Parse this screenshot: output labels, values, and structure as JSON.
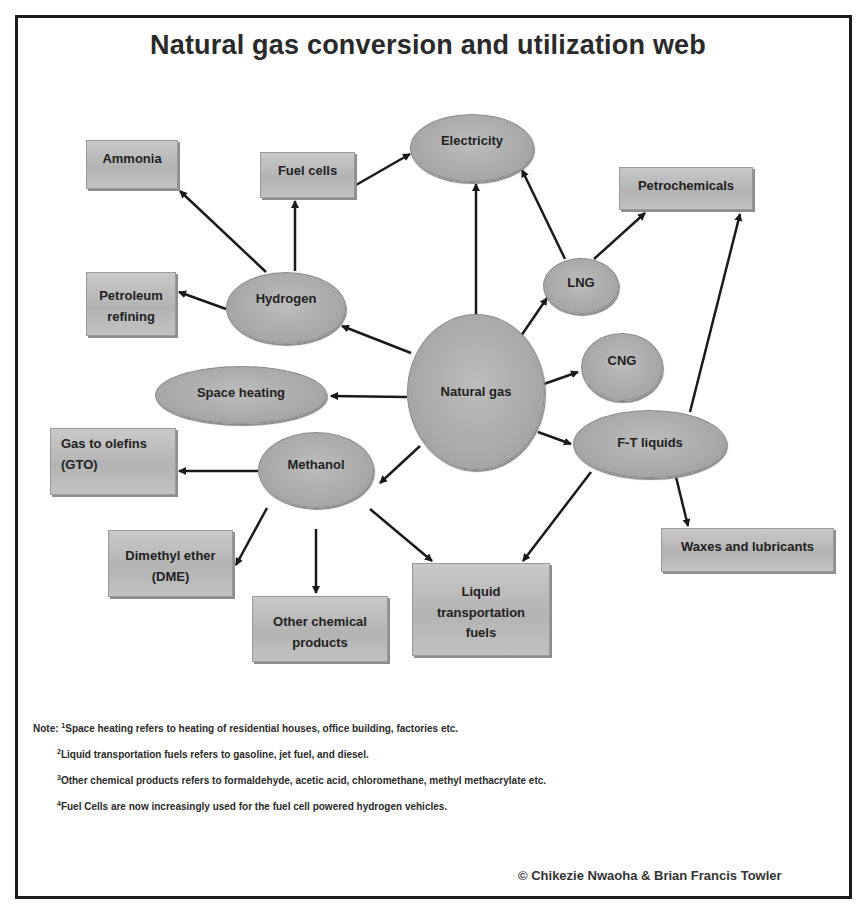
{
  "title": "Natural gas conversion and utilization web",
  "nodes": {
    "natural_gas": {
      "label": "Natural gas",
      "shape": "ellipse"
    },
    "electricity": {
      "label": "Electricity",
      "shape": "ellipse"
    },
    "hydrogen": {
      "label": "Hydrogen",
      "shape": "ellipse"
    },
    "lng": {
      "label": "LNG",
      "shape": "ellipse"
    },
    "cng": {
      "label": "CNG",
      "shape": "ellipse"
    },
    "space_heating": {
      "label": "Space heating",
      "shape": "ellipse"
    },
    "ft_liquids": {
      "label": "F-T liquids",
      "shape": "ellipse"
    },
    "methanol": {
      "label": "Methanol",
      "shape": "ellipse"
    },
    "ammonia": {
      "label": "Ammonia",
      "shape": "box"
    },
    "fuel_cells": {
      "label": "Fuel cells",
      "shape": "box"
    },
    "petrochemicals": {
      "label": "Petrochemicals",
      "shape": "box"
    },
    "petroleum_refining": {
      "line1": "Petroleum",
      "line2": "refining",
      "shape": "box"
    },
    "gas_to_olefins": {
      "line1": "Gas to olefins",
      "line2": "(GTO)",
      "shape": "box"
    },
    "dimethyl_ether": {
      "line1": "Dimethyl ether",
      "line2": "(DME)",
      "shape": "box"
    },
    "waxes_lubricants": {
      "label": "Waxes and lubricants",
      "shape": "box"
    },
    "liquid_transportation_fuels": {
      "line1": "Liquid",
      "line2": "transportation",
      "line3": "fuels",
      "shape": "box"
    },
    "other_chemical_products": {
      "line1": "Other chemical",
      "line2": "products",
      "shape": "box"
    }
  },
  "edges": [
    {
      "from": "Natural gas",
      "to": "Electricity"
    },
    {
      "from": "Natural gas",
      "to": "Hydrogen"
    },
    {
      "from": "Natural gas",
      "to": "LNG"
    },
    {
      "from": "Natural gas",
      "to": "CNG"
    },
    {
      "from": "Natural gas",
      "to": "Space heating"
    },
    {
      "from": "Natural gas",
      "to": "F-T liquids"
    },
    {
      "from": "Natural gas",
      "to": "Methanol"
    },
    {
      "from": "Hydrogen",
      "to": "Ammonia"
    },
    {
      "from": "Hydrogen",
      "to": "Fuel cells"
    },
    {
      "from": "Hydrogen",
      "to": "Petroleum refining"
    },
    {
      "from": "Fuel cells",
      "to": "Electricity"
    },
    {
      "from": "LNG",
      "to": "Electricity"
    },
    {
      "from": "LNG",
      "to": "Petrochemicals"
    },
    {
      "from": "F-T liquids",
      "to": "Petrochemicals"
    },
    {
      "from": "F-T liquids",
      "to": "Waxes and lubricants"
    },
    {
      "from": "F-T liquids",
      "to": "Liquid transportation fuels"
    },
    {
      "from": "Methanol",
      "to": "Gas to olefins (GTO)"
    },
    {
      "from": "Methanol",
      "to": "Dimethyl ether (DME)"
    },
    {
      "from": "Methanol",
      "to": "Other chemical products"
    },
    {
      "from": "Methanol",
      "to": "Liquid transportation fuels"
    }
  ],
  "notes": {
    "prefix": "Note: ",
    "items": [
      {
        "num": "1",
        "text": "Space heating refers to heating of residential houses, office building, factories etc."
      },
      {
        "num": "2",
        "text": "Liquid transportation fuels refers to gasoline, jet fuel, and diesel."
      },
      {
        "num": "3",
        "text": "Other chemical products refers to formaldehyde, acetic acid, chloromethane, methyl methacrylate etc."
      },
      {
        "num": "4",
        "text": "Fuel Cells are now increasingly used for the fuel cell powered hydrogen vehicles."
      }
    ]
  },
  "copyright": "© Chikezie Nwaoha & Brian Francis Towler",
  "colors": {
    "node_fill": "#b5b5b5",
    "arrow": "#1a1a1a",
    "frame": "#1c1c1c"
  }
}
